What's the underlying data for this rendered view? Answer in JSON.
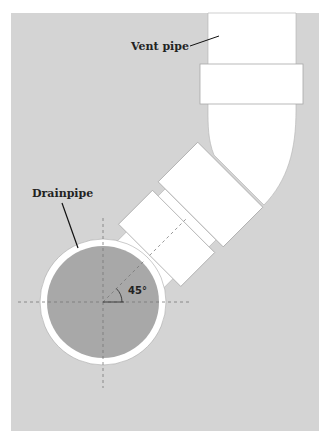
{
  "diagram": {
    "labels": {
      "vent_pipe": "Vent pipe",
      "drainpipe": "Drainpipe",
      "angle": "45°"
    },
    "colors": {
      "background": "#d3d3d3",
      "pipe_fill": "#ffffff",
      "pipe_stroke": "#aaaaaa",
      "drain_interior": "#a9a9a9",
      "leader_line": "#111111",
      "centerline": "#777777"
    }
  }
}
